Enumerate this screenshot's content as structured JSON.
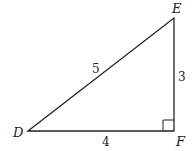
{
  "diagram": {
    "type": "right-triangle",
    "vertices": [
      {
        "name": "D",
        "x": 28,
        "y": 131
      },
      {
        "name": "E",
        "x": 174,
        "y": 18
      },
      {
        "name": "F",
        "x": 174,
        "y": 131
      }
    ],
    "sides": [
      {
        "from": "D",
        "to": "E",
        "length_label": "5"
      },
      {
        "from": "E",
        "to": "F",
        "length_label": "3"
      },
      {
        "from": "D",
        "to": "F",
        "length_label": "4"
      }
    ],
    "right_angle_at": "F",
    "line_color": "#222222"
  },
  "labels": {
    "D": "D",
    "E": "E",
    "F": "F",
    "side_DE": "5",
    "side_EF": "3",
    "side_DF": "4"
  }
}
